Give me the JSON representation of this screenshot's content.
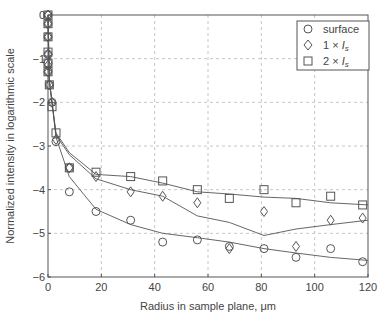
{
  "chart_data": {
    "type": "scatter",
    "title": "",
    "xlabel": "Radius in sample plane, μm",
    "ylabel": "Normalized intensity in logarithmic scale",
    "xlim": [
      0,
      120
    ],
    "ylim": [
      -6,
      0
    ],
    "xticks": [
      0,
      20,
      40,
      60,
      80,
      100,
      120
    ],
    "yticks": [
      0,
      -1,
      -2,
      -3,
      -4,
      -5,
      -6
    ],
    "grid": true,
    "legend_position": "upper right",
    "series": [
      {
        "name": "surface",
        "marker": "circle",
        "points": [
          [
            0,
            0
          ],
          [
            0,
            -0.2
          ],
          [
            0,
            -0.5
          ],
          [
            0,
            -0.9
          ],
          [
            0,
            -1.1
          ],
          [
            0,
            -1.3
          ],
          [
            0.5,
            -1.6
          ],
          [
            1.5,
            -2.0
          ],
          [
            3,
            -2.9
          ],
          [
            8,
            -3.5
          ],
          [
            8,
            -4.05
          ],
          [
            18,
            -4.5
          ],
          [
            31,
            -4.7
          ],
          [
            43,
            -5.2
          ],
          [
            56,
            -5.15
          ],
          [
            68,
            -5.3
          ],
          [
            81,
            -5.35
          ],
          [
            93,
            -5.55
          ],
          [
            106,
            -5.35
          ],
          [
            118,
            -5.65
          ]
        ],
        "fit": [
          [
            0,
            0
          ],
          [
            0.5,
            -1.5
          ],
          [
            1.5,
            -2.0
          ],
          [
            3,
            -2.8
          ],
          [
            8,
            -3.7
          ],
          [
            18,
            -4.45
          ],
          [
            31,
            -4.8
          ],
          [
            43,
            -5.0
          ],
          [
            56,
            -5.1
          ],
          [
            68,
            -5.2
          ],
          [
            81,
            -5.35
          ],
          [
            93,
            -5.45
          ],
          [
            106,
            -5.55
          ],
          [
            120,
            -5.62
          ]
        ]
      },
      {
        "name": "1 × I_s",
        "marker": "diamond",
        "points": [
          [
            0,
            0
          ],
          [
            0,
            -0.2
          ],
          [
            0,
            -0.5
          ],
          [
            0,
            -0.9
          ],
          [
            0,
            -1.15
          ],
          [
            0,
            -1.3
          ],
          [
            0.5,
            -1.6
          ],
          [
            1.5,
            -2.0
          ],
          [
            3,
            -2.85
          ],
          [
            8,
            -3.5
          ],
          [
            18,
            -3.7
          ],
          [
            31,
            -4.05
          ],
          [
            43,
            -4.15
          ],
          [
            56,
            -4.3
          ],
          [
            68,
            -5.35
          ],
          [
            81,
            -4.5
          ],
          [
            93,
            -5.3
          ],
          [
            106,
            -4.7
          ],
          [
            118,
            -4.65
          ]
        ],
        "fit": [
          [
            0,
            0
          ],
          [
            0.5,
            -1.5
          ],
          [
            1.5,
            -2.0
          ],
          [
            3,
            -2.75
          ],
          [
            8,
            -3.2
          ],
          [
            18,
            -3.75
          ],
          [
            31,
            -4.0
          ],
          [
            43,
            -4.15
          ],
          [
            56,
            -4.6
          ],
          [
            68,
            -4.75
          ],
          [
            81,
            -5.05
          ],
          [
            93,
            -4.9
          ],
          [
            106,
            -4.8
          ],
          [
            120,
            -4.7
          ]
        ]
      },
      {
        "name": "2 × I_s",
        "marker": "square",
        "points": [
          [
            0,
            0
          ],
          [
            0,
            -0.2
          ],
          [
            0,
            -0.5
          ],
          [
            0,
            -0.85
          ],
          [
            0,
            -1.1
          ],
          [
            0,
            -1.3
          ],
          [
            0.5,
            -1.6
          ],
          [
            1.5,
            -2.1
          ],
          [
            3,
            -2.7
          ],
          [
            8,
            -3.5
          ],
          [
            18,
            -3.6
          ],
          [
            31,
            -3.7
          ],
          [
            43,
            -3.8
          ],
          [
            56,
            -4.0
          ],
          [
            68,
            -4.2
          ],
          [
            81,
            -4.0
          ],
          [
            93,
            -4.3
          ],
          [
            106,
            -4.15
          ],
          [
            118,
            -4.35
          ]
        ],
        "fit": [
          [
            0,
            0
          ],
          [
            0.5,
            -1.5
          ],
          [
            1.5,
            -2.0
          ],
          [
            3,
            -2.7
          ],
          [
            8,
            -3.15
          ],
          [
            18,
            -3.65
          ],
          [
            31,
            -3.7
          ],
          [
            43,
            -3.85
          ],
          [
            56,
            -4.05
          ],
          [
            68,
            -4.1
          ],
          [
            81,
            -4.17
          ],
          [
            93,
            -4.2
          ],
          [
            106,
            -4.3
          ],
          [
            120,
            -4.35
          ]
        ]
      }
    ]
  },
  "legend": {
    "items": [
      {
        "marker": "circle",
        "label": "surface"
      },
      {
        "marker": "diamond",
        "label_prefix": "1 × ",
        "label_var": "I",
        "label_sub": "s"
      },
      {
        "marker": "square",
        "label_prefix": "2 × ",
        "label_var": "I",
        "label_sub": "s"
      }
    ]
  },
  "axes": {
    "xlabel_prefix": "Radius in sample plane, ",
    "xlabel_unit": "μm",
    "ylabel": "Normalized intensity in logarithmic scale",
    "xtick_labels": [
      "0",
      "20",
      "40",
      "60",
      "80",
      "100",
      "120"
    ],
    "ytick_labels": [
      "0",
      "−1",
      "−2",
      "−3",
      "−4",
      "−5",
      "−6"
    ]
  },
  "colors": {
    "axis": "#555555",
    "grid": "#b8b8b8",
    "marker": "#555555",
    "line": "#555555"
  }
}
